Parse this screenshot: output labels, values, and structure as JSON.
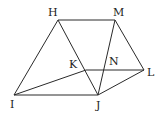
{
  "diagram": {
    "type": "geometry",
    "points": {
      "H": {
        "label": "H",
        "x": 58,
        "y": 20,
        "lx": 48,
        "ly": 16
      },
      "M": {
        "label": "M",
        "x": 115,
        "y": 20,
        "lx": 113,
        "ly": 16
      },
      "I": {
        "label": "I",
        "x": 14,
        "y": 95,
        "lx": 10,
        "ly": 108
      },
      "J": {
        "label": "J",
        "x": 98,
        "y": 95,
        "lx": 96,
        "ly": 109
      },
      "L": {
        "label": "L",
        "x": 144,
        "y": 70,
        "lx": 147,
        "ly": 76
      },
      "K": {
        "label": "K",
        "x": 86,
        "y": 70,
        "lx": 69,
        "ly": 68
      },
      "N": {
        "label": "N",
        "x": 105,
        "y": 70,
        "lx": 109,
        "ly": 65
      }
    },
    "segments": [
      [
        "H",
        "M"
      ],
      [
        "H",
        "I"
      ],
      [
        "H",
        "J"
      ],
      [
        "M",
        "J"
      ],
      [
        "M",
        "L"
      ],
      [
        "I",
        "J"
      ],
      [
        "I",
        "K"
      ],
      [
        "K",
        "L"
      ],
      [
        "J",
        "L"
      ]
    ],
    "colors": {
      "line": "#2a2a2a",
      "text": "#222222",
      "background": "#ffffff"
    }
  }
}
